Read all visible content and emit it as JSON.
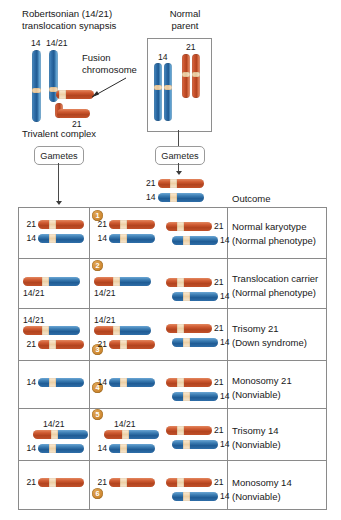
{
  "figure": {
    "title_left": "Robertsonian (14/21)\ntranslocation synapsis",
    "trivalent_label": "Trivalent complex",
    "fusion_label": "Fusion\nchromosome",
    "normal_parent_label": "Normal\nparent",
    "outcome_header": "Outcome",
    "gametes_left": "Gametes",
    "gametes_right": "Gametes"
  },
  "trivalent": {
    "chr14_label": "14",
    "chr1421_label": "14/21",
    "chr21_label": "21"
  },
  "normal_parent": {
    "chr14_label": "14",
    "chr21_label": "21"
  },
  "normal_gametes": [
    {
      "label": "21",
      "type": "red"
    },
    {
      "label": "14",
      "type": "blue"
    }
  ],
  "colors": {
    "chromosome_blue": "#2f6ea8",
    "chromosome_red": "#c8502b",
    "centromere": "#edd0a6",
    "badge": "#cf8a34",
    "rule": "#8a8a8a"
  },
  "table": {
    "rows": [
      {
        "badge": "1",
        "gamete": [
          {
            "label": "21",
            "kind": "red"
          },
          {
            "label": "14",
            "kind": "blue"
          }
        ],
        "zygote_left": [
          {
            "label": "21",
            "kind": "red"
          },
          {
            "label": "14",
            "kind": "blue"
          }
        ],
        "zygote_right": [
          {
            "label": "21",
            "kind": "red"
          },
          {
            "label": "14",
            "kind": "blue"
          }
        ],
        "outcome": "Normal karyotype",
        "phenotype": "(Normal phenotype)"
      },
      {
        "badge": "2",
        "gamete": [
          {
            "label": "14/21",
            "kind": "fusion"
          }
        ],
        "zygote_left": [
          {
            "label": "14/21",
            "kind": "fusion"
          }
        ],
        "zygote_right": [
          {
            "label": "21",
            "kind": "red"
          },
          {
            "label": "14",
            "kind": "blue"
          }
        ],
        "outcome": "Translocation carrier",
        "phenotype": "(Normal phenotype)"
      },
      {
        "badge": "3",
        "gamete": [
          {
            "label": "14/21",
            "kind": "fusion"
          },
          {
            "label": "21",
            "kind": "red"
          }
        ],
        "zygote_left": [
          {
            "label": "14/21",
            "kind": "fusion"
          },
          {
            "label": "21",
            "kind": "red"
          }
        ],
        "zygote_right": [
          {
            "label": "21",
            "kind": "red"
          },
          {
            "label": "14",
            "kind": "blue"
          }
        ],
        "outcome": "Trisomy 21",
        "phenotype": "(Down syndrome)"
      },
      {
        "badge": "4",
        "gamete": [
          {
            "label": "14",
            "kind": "blue"
          }
        ],
        "zygote_left": [
          {
            "label": "14",
            "kind": "blue"
          }
        ],
        "zygote_right": [
          {
            "label": "21",
            "kind": "red"
          },
          {
            "label": "14",
            "kind": "blue"
          }
        ],
        "outcome": "Monosomy 21",
        "phenotype": "(Nonviable)"
      },
      {
        "badge": "5",
        "gamete": [
          {
            "label": "14/21",
            "kind": "fusion"
          },
          {
            "label": "14",
            "kind": "blue"
          }
        ],
        "zygote_left": [
          {
            "label": "14/21",
            "kind": "fusion"
          },
          {
            "label": "14",
            "kind": "blue"
          }
        ],
        "zygote_right": [
          {
            "label": "21",
            "kind": "red"
          },
          {
            "label": "14",
            "kind": "blue"
          }
        ],
        "outcome": "Trisomy 14",
        "phenotype": "(Nonviable)"
      },
      {
        "badge": "6",
        "gamete": [
          {
            "label": "21",
            "kind": "red"
          }
        ],
        "zygote_left": [
          {
            "label": "21",
            "kind": "red"
          }
        ],
        "zygote_right": [
          {
            "label": "21",
            "kind": "red"
          },
          {
            "label": "14",
            "kind": "blue"
          }
        ],
        "outcome": "Monosomy 14",
        "phenotype": "(Nonviable)"
      }
    ]
  }
}
